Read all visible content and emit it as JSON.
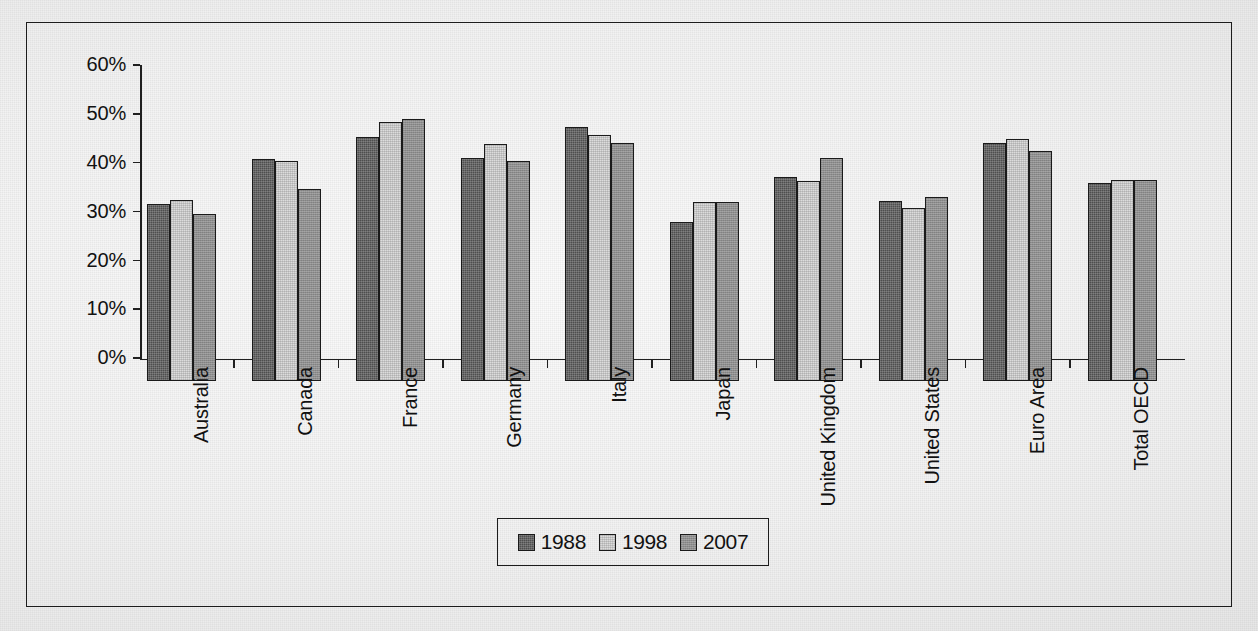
{
  "figure": {
    "border_color": "#1c1c1c",
    "background_color": "#eeeeee"
  },
  "chart_data": {
    "type": "bar",
    "title": "",
    "xlabel": "",
    "ylabel": "",
    "ylim": [
      0,
      60
    ],
    "ytick_labels": [
      "0%",
      "10%",
      "20%",
      "30%",
      "40%",
      "50%",
      "60%"
    ],
    "ytick_values": [
      0,
      10,
      20,
      30,
      40,
      50,
      60
    ],
    "grid": false,
    "legend_position": "bottom-center",
    "categories": [
      "Australia",
      "Canada",
      "France",
      "Germany",
      "Italy",
      "Japan",
      "United Kingdom",
      "United States",
      "Euro Area",
      "Total OECD"
    ],
    "series": [
      {
        "name": "1988",
        "color": "#4e4e4e",
        "values": [
          36.3,
          45.5,
          50.0,
          45.6,
          52.0,
          32.5,
          41.7,
          36.9,
          48.7,
          40.5
        ]
      },
      {
        "name": "1998",
        "color": "#dcdcdc",
        "values": [
          37.0,
          45.0,
          53.0,
          48.5,
          50.3,
          36.7,
          41.0,
          35.5,
          49.5,
          41.1
        ]
      },
      {
        "name": "2007",
        "color": "#8e8e8e",
        "values": [
          34.1,
          39.3,
          53.7,
          45.1,
          48.8,
          36.6,
          45.6,
          37.7,
          47.2,
          41.1
        ]
      }
    ]
  },
  "legend": {
    "entries": [
      {
        "label": "1988",
        "swatch": "dark-gray-swatch"
      },
      {
        "label": "1998",
        "swatch": "white-swatch"
      },
      {
        "label": "2007",
        "swatch": "medium-gray-swatch"
      }
    ]
  }
}
